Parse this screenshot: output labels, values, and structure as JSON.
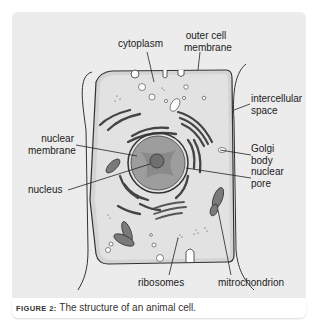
{
  "figure": {
    "title": "The structure of an animal cell.",
    "caption_label": "FIGURE 2:"
  },
  "labels": {
    "cytoplasm": "cytoplasm",
    "outer_cell_membrane_1": "outer cell",
    "outer_cell_membrane_2": "membrane",
    "intercellular_space_1": "intercellular",
    "intercellular_space_2": "space",
    "nuclear_membrane_1": "nuclear",
    "nuclear_membrane_2": "membrane",
    "golgi_body_1": "Golgi",
    "golgi_body_2": "body",
    "nucleus": "nucleus",
    "nuclear_pore_1": "nuclear",
    "nuclear_pore_2": "pore",
    "ribosomes": "ribosomes",
    "mitochondrion": "mitrochondrion"
  },
  "colors": {
    "panel_bg": "#ececec",
    "cell_fill": "#d9d9d9",
    "nucleus_fill": "#9a9a9a",
    "nucleolus_fill": "#6f6f6f",
    "line": "#333333"
  }
}
